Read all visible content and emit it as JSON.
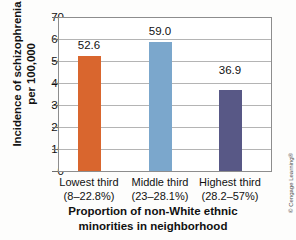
{
  "chart_data": {
    "type": "bar",
    "title": "",
    "subtitle": "",
    "xlabel": "Proportion of non-White ethnic minorities in neighborhood",
    "xlabel_lines": [
      "Proportion of non-White ethnic",
      "minorities in neighborhood"
    ],
    "ylabel": "Incidence of schizophrenia per 100,000",
    "ylabel_lines": [
      "Incidence of schizophrenia",
      "per 100,000"
    ],
    "categories": [
      "Lowest third (8–22.8%)",
      "Middle third (23–28.1%)",
      "Highest third (28.2–57%)"
    ],
    "category_lines": [
      {
        "line1": "Lowest third",
        "line2": "(8–22.8%)"
      },
      {
        "line1": "Middle third",
        "line2": "(23–28.1%)"
      },
      {
        "line1": "Highest third",
        "line2": "(28.2–57%)"
      }
    ],
    "values": [
      52.6,
      59.0,
      36.9
    ],
    "value_labels": [
      "52.6",
      "59.0",
      "36.9"
    ],
    "bar_colors": [
      "#D9662E",
      "#7BA7CC",
      "#585886"
    ],
    "ylim": [
      0,
      70
    ],
    "ytick_step": 10,
    "ytick_labels": [
      "70",
      "60",
      "50",
      "40",
      "30",
      "20",
      "10",
      "0"
    ],
    "ytick_values": [
      70,
      60,
      50,
      40,
      30,
      20,
      10,
      0
    ],
    "xlim_categories": 3,
    "grid": "horizontal",
    "legend": "none",
    "legend_position": "none",
    "plot_border": true,
    "colors": {
      "background": "#fdfdfc",
      "plot_background": "#ffffff",
      "gridline": "#b4b4b4",
      "axis_border": "#8d8d8d",
      "text": "#111111"
    }
  },
  "credit": {
    "text": "© Cengage Learning®"
  }
}
